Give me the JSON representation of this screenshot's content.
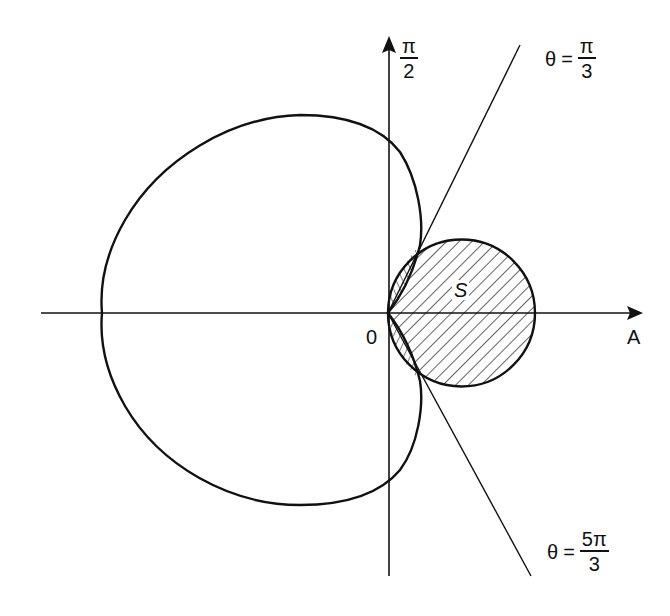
{
  "figure": {
    "type": "polar-region-diagram",
    "labels": {
      "pole": "0",
      "polar_axis": "A",
      "vertical_axis": {
        "num": "π",
        "den": "2"
      },
      "ray_upper": {
        "var": "θ",
        "eq": "=",
        "num": "π",
        "den": "3"
      },
      "ray_lower": {
        "var": "θ",
        "eq": "=",
        "num": "5π",
        "den": "3"
      },
      "region": "S"
    },
    "colors": {
      "stroke": "#111111",
      "background": "#ffffff"
    },
    "elements": [
      "horizontal polar axis with arrow labeled A",
      "vertical axis with arrow labeled π/2",
      "limaçon-like closed curve passing through pole",
      "circle tangent to vertical axis at pole",
      "ray θ = π/3",
      "ray θ = 5π/3",
      "hatched region S inside circle"
    ]
  }
}
